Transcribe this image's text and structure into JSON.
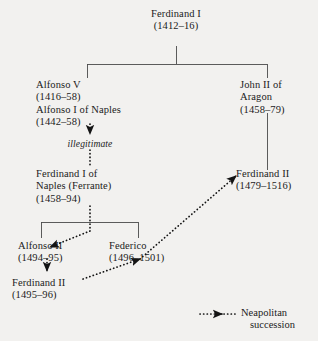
{
  "diagram": {
    "colors": {
      "background": "#f2f1ef",
      "text": "#1b1b1b",
      "line": "#4a4a4a",
      "succession": "#141414"
    },
    "nodes": [
      {
        "id": "ferdinand-i",
        "name": "Ferdinand I",
        "dates": "(1412–16)",
        "line3": ""
      },
      {
        "id": "alfonso-v",
        "name": "Alfonso V",
        "dates": "(1416–58)",
        "line3": "Alfonso I of Naples",
        "line4": "(1442–58)"
      },
      {
        "id": "john-ii-aragon",
        "name": "John II of",
        "dates": "Aragon",
        "line3": "(1458–79)"
      },
      {
        "id": "ferrante",
        "name": "Ferdinand I of",
        "dates": "Naples (Ferrante)",
        "line3": "(1458–94)"
      },
      {
        "id": "ferdinand-ii-aragon",
        "name": "Ferdinand II",
        "dates": "(1479–1516)",
        "line3": ""
      },
      {
        "id": "alfonso-ii",
        "name": "Alfonso II",
        "dates": "(1494–95)",
        "line3": ""
      },
      {
        "id": "federico",
        "name": "Federico",
        "dates": "(1496–1501)",
        "line3": ""
      },
      {
        "id": "ferdinand-ii-naples",
        "name": "Ferdinand II",
        "dates": "(1495–96)",
        "line3": ""
      }
    ],
    "edge_labels": {
      "illegitimate": "illegitimate"
    },
    "legend": {
      "label_line1": "Neapolitan",
      "label_line2": "succession"
    }
  }
}
